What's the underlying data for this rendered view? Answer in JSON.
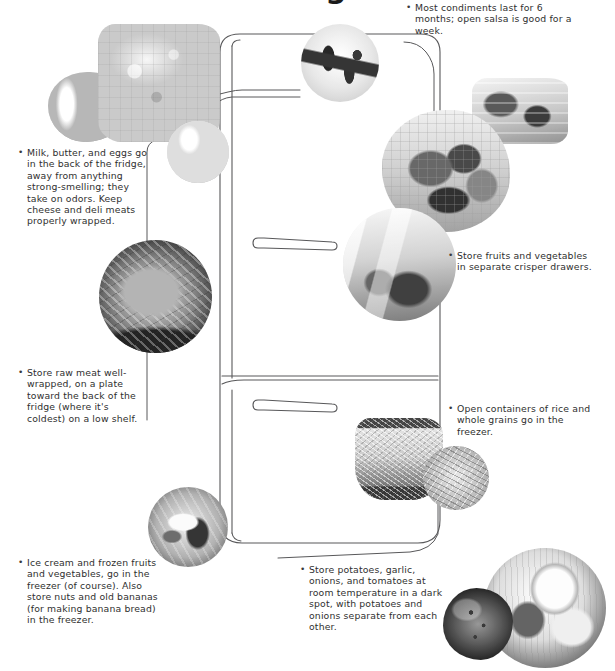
{
  "page": {
    "title": "Food Storage Guide",
    "title_visible_fragment": "g",
    "bullet_glyph": "•"
  },
  "diagram": {
    "parts": [
      {
        "name": "fridge-door",
        "label": "Fridge compartment door"
      },
      {
        "name": "freezer-door",
        "label": "Freezer compartment door"
      },
      {
        "name": "fridge-handle",
        "label": "Fridge door handle"
      },
      {
        "name": "freezer-handle",
        "label": "Freezer door handle"
      }
    ]
  },
  "notes": [
    {
      "id": "condiments",
      "text": "Most condiments last for 6 months; open salsa is good for a week.",
      "position": "top-right"
    },
    {
      "id": "dairy",
      "text": "Milk, butter, and eggs go in the back of the fridge, away from anything strong-smelling; they take on odors. Keep cheese and deli meats properly wrapped.",
      "position": "upper-left"
    },
    {
      "id": "raw-meat",
      "text": "Store raw meat well-wrapped, on a plate toward the back of the fridge (where it's coldest) on a low shelf.",
      "position": "mid-left"
    },
    {
      "id": "produce",
      "text": "Store fruits and vegetables in separate crisper drawers.",
      "position": "mid-right"
    },
    {
      "id": "grains",
      "text": "Open containers of rice and whole grains go in the freezer.",
      "position": "lower-right"
    },
    {
      "id": "frozen",
      "text": "Ice cream and frozen fruits and vegetables, go in the freezer (of course). Also store nuts and old bananas (for making banana bread) in the freezer.",
      "position": "bottom-left"
    },
    {
      "id": "room-temp",
      "text": "Store potatoes, garlic, onions, and tomatoes at room temperature in a dark spot, with potatoes and onions separate from each other.",
      "position": "bottom-center"
    }
  ],
  "photos": [
    {
      "id": "jars",
      "alt": "jars-and-preserves-photo"
    },
    {
      "id": "cheese",
      "alt": "cheese-wedges-photo"
    },
    {
      "id": "eggs",
      "alt": "eggs-and-dairy-photo"
    },
    {
      "id": "condiments",
      "alt": "condiment-bottles-photo"
    },
    {
      "id": "deli",
      "alt": "deli-meats-photo"
    },
    {
      "id": "veg-basket",
      "alt": "vegetable-basket-photo"
    },
    {
      "id": "meat",
      "alt": "raw-steak-photo"
    },
    {
      "id": "produce-bag",
      "alt": "bagged-produce-photo"
    },
    {
      "id": "rice",
      "alt": "bowl-of-rice-photo"
    },
    {
      "id": "grain",
      "alt": "whole-grains-photo"
    },
    {
      "id": "frozen",
      "alt": "frozen-food-photo"
    },
    {
      "id": "garlic",
      "alt": "garlic-and-onions-photo"
    },
    {
      "id": "potato",
      "alt": "potatoes-photo"
    }
  ],
  "colors": {
    "ink": "#2f2f2f",
    "line": "#58585a",
    "background": "#ffffff"
  }
}
